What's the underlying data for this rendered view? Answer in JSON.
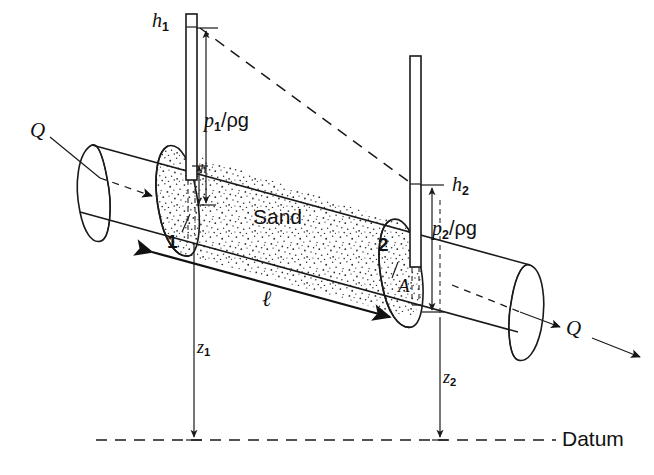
{
  "figure": {
    "background_color": "#ffffff",
    "ink_color": "#111111",
    "width": 654,
    "height": 475
  },
  "labels": {
    "h1": "h",
    "h1_sub": "1",
    "h2": "h",
    "h2_sub": "2",
    "p1_head": "p",
    "p1_sub": "1",
    "p1_denom": "/ρg",
    "p2_head": "p",
    "p2_sub": "2",
    "p2_denom": "/ρg",
    "z1": "z",
    "z1_sub": "1",
    "z2": "z",
    "z2_sub": "2",
    "section_1": "1",
    "section_2": "2",
    "area": "A",
    "length": "ℓ",
    "head_loss": "h",
    "sand": "Sand",
    "datum": "Datum",
    "flow_in": "Q",
    "flow_out": "Q"
  },
  "annotations": {
    "sand_region_label": "Sand",
    "datum_line_label": "Datum",
    "inlet_flow_label": "Q",
    "outlet_flow_label": "Q",
    "upstream_section_label": "1",
    "downstream_section_label": "2",
    "cross_section_area_label": "A",
    "sample_length_label": "ℓ",
    "upstream_pressure_head_label": "p₁/ρg",
    "downstream_pressure_head_label": "p₂/ρg",
    "upstream_total_head_label": "h₁",
    "downstream_total_head_label": "h₂",
    "upstream_elevation_label": "z₁",
    "downstream_elevation_label": "z₂",
    "head_difference_label": "h"
  },
  "colors": {
    "ink": "#111111",
    "sand_stipple": "#3a3a3a",
    "paper": "#ffffff"
  }
}
